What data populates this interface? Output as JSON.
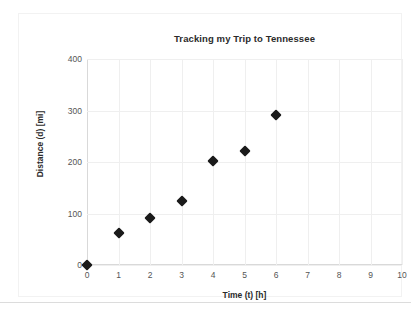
{
  "chart_data": {
    "type": "scatter",
    "title": "Tracking my Trip to Tennessee",
    "xlabel": "Time (t) [h]",
    "ylabel": "Distance (d) [mi]",
    "x": [
      0,
      1,
      2,
      3,
      4,
      5,
      6
    ],
    "values": [
      0,
      62,
      92,
      125,
      201,
      222,
      292
    ],
    "series": [
      {
        "name": "Distance",
        "points": [
          {
            "x": 0,
            "y": 0
          },
          {
            "x": 1,
            "y": 62
          },
          {
            "x": 2,
            "y": 92
          },
          {
            "x": 3,
            "y": 125
          },
          {
            "x": 4,
            "y": 201
          },
          {
            "x": 5,
            "y": 222
          },
          {
            "x": 6,
            "y": 292
          }
        ]
      }
    ],
    "xlim": [
      0,
      10
    ],
    "ylim": [
      0,
      400
    ],
    "xticks": [
      "0",
      "1",
      "2",
      "3",
      "4",
      "5",
      "6",
      "7",
      "8",
      "9",
      "10"
    ],
    "yticks": [
      "0",
      "100",
      "200",
      "300",
      "400"
    ],
    "xtick_values": [
      0,
      1,
      2,
      3,
      4,
      5,
      6,
      7,
      8,
      9,
      10
    ],
    "ytick_values": [
      0,
      100,
      200,
      300,
      400
    ],
    "grid": true,
    "legend": false,
    "marker": "diamond",
    "marker_color": "#1a1a1a",
    "grid_color": "#efefef",
    "axis_color": "#d9d9d9"
  }
}
